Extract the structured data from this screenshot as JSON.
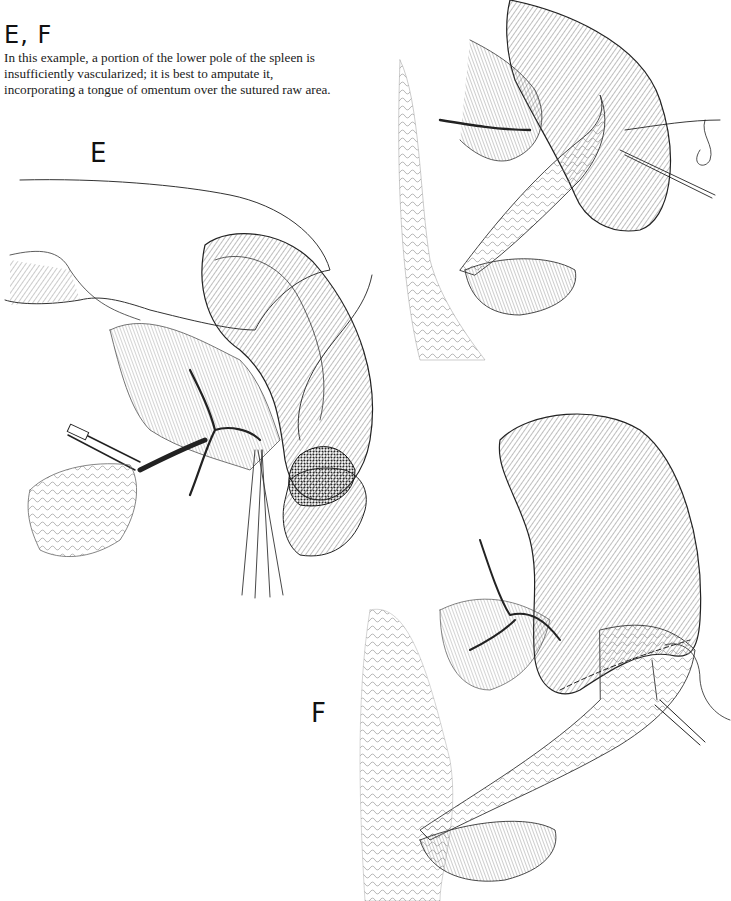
{
  "figure": {
    "title": "E, F",
    "caption_lines": [
      "In this example, a portion of the lower pole of the spleen is",
      "insufficiently vascularized; it is best to amputate it,",
      "incorporating a tongue of omentum over the sutured raw area."
    ],
    "panels": [
      {
        "label": "E",
        "description": "Clamped hilar vessels with hand retracting spleen; ischemic lower pole being amputated with suture"
      },
      {
        "label": "F",
        "description": "Spleen after amputation with omentum tongue sutured over raw area; needle holder with suture"
      },
      {
        "label": "",
        "description": "Upper right: suturing of omental tongue over raw surface with needle and thread"
      }
    ]
  }
}
